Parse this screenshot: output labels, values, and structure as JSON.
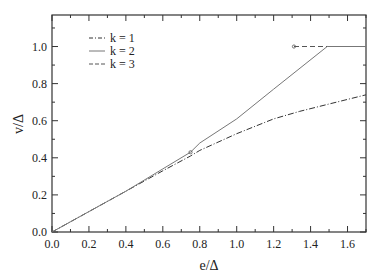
{
  "chart_data": {
    "type": "line",
    "title": "",
    "xlabel": "e/Δ",
    "ylabel": "v/Δ",
    "xlim": [
      0.0,
      1.7
    ],
    "ylim": [
      0.0,
      1.17
    ],
    "grid": false,
    "legend_position": "upper-left",
    "x_ticks": [
      "0.0",
      "0.2",
      "0.4",
      "0.6",
      "0.8",
      "1.0",
      "1.2",
      "1.4",
      "1.6"
    ],
    "y_ticks": [
      "0.0",
      "0.2",
      "0.4",
      "0.6",
      "0.8",
      "1.0"
    ],
    "series": [
      {
        "name": "k = 1",
        "style": "dash-dot",
        "x": [
          0.0,
          0.2,
          0.4,
          0.6,
          0.75,
          0.8,
          1.0,
          1.2,
          1.34,
          1.5,
          1.7
        ],
        "y": [
          0.0,
          0.11,
          0.22,
          0.33,
          0.41,
          0.44,
          0.53,
          0.61,
          0.65,
          0.69,
          0.74
        ]
      },
      {
        "name": "k = 2",
        "style": "solid",
        "x": [
          0.0,
          0.2,
          0.4,
          0.6,
          0.75,
          0.8,
          1.0,
          1.2,
          1.49,
          1.7
        ],
        "y": [
          0.0,
          0.11,
          0.22,
          0.34,
          0.43,
          0.48,
          0.61,
          0.77,
          1.0,
          1.0
        ]
      },
      {
        "name": "k = 3",
        "style": "dashed",
        "x": [
          1.31,
          1.49
        ],
        "y": [
          1.0,
          1.0
        ]
      }
    ],
    "markers": [
      {
        "series": "k = 2",
        "x": 0.75,
        "y": 0.43
      },
      {
        "series": "k = 3",
        "x": 1.31,
        "y": 1.0
      }
    ]
  },
  "legend": {
    "items": [
      {
        "label": "k = 1"
      },
      {
        "label": "k = 2"
      },
      {
        "label": "k = 3"
      }
    ]
  },
  "axes": {
    "xlabel": "e/Δ",
    "ylabel": "v/Δ",
    "x_ticks": [
      "0.0",
      "0.2",
      "0.4",
      "0.6",
      "0.8",
      "1.0",
      "1.2",
      "1.4",
      "1.6"
    ],
    "y_ticks": [
      "0.0",
      "0.2",
      "0.4",
      "0.6",
      "0.8",
      "1.0"
    ]
  }
}
